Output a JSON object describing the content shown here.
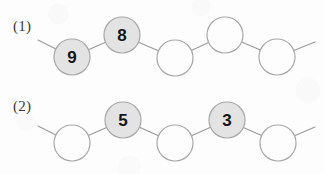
{
  "canvas": {
    "width": 324,
    "height": 174,
    "background": "#fdfdfd"
  },
  "style": {
    "circle_radius": 18,
    "filled_fill": "#e3e3e3",
    "empty_fill": "#fdfdfd",
    "circle_stroke": "#a8a8a8",
    "line_stroke": "#9a9a9a",
    "digit_color": "#161616",
    "label_color": "#3a3a3a"
  },
  "rows": [
    {
      "label": "(1)",
      "label_x": 13,
      "label_y": 18,
      "left_stub": {
        "x": 38,
        "y": 40
      },
      "right_stub": {
        "x": 315,
        "y": 42
      },
      "nodes": [
        {
          "value": "9",
          "filled": true,
          "cx": 72,
          "cy": 57
        },
        {
          "value": "8",
          "filled": true,
          "cx": 122,
          "cy": 35
        },
        {
          "value": "",
          "filled": false,
          "cx": 175,
          "cy": 58
        },
        {
          "value": "",
          "filled": false,
          "cx": 225,
          "cy": 35
        },
        {
          "value": "",
          "filled": false,
          "cx": 277,
          "cy": 57
        }
      ]
    },
    {
      "label": "(2)",
      "label_x": 13,
      "label_y": 98,
      "left_stub": {
        "x": 38,
        "y": 126
      },
      "right_stub": {
        "x": 315,
        "y": 127
      },
      "nodes": [
        {
          "value": "",
          "filled": false,
          "cx": 72,
          "cy": 143
        },
        {
          "value": "5",
          "filled": true,
          "cx": 123,
          "cy": 120
        },
        {
          "value": "",
          "filled": false,
          "cx": 175,
          "cy": 143
        },
        {
          "value": "3",
          "filled": true,
          "cx": 227,
          "cy": 120
        },
        {
          "value": "",
          "filled": false,
          "cx": 278,
          "cy": 143
        }
      ]
    }
  ]
}
